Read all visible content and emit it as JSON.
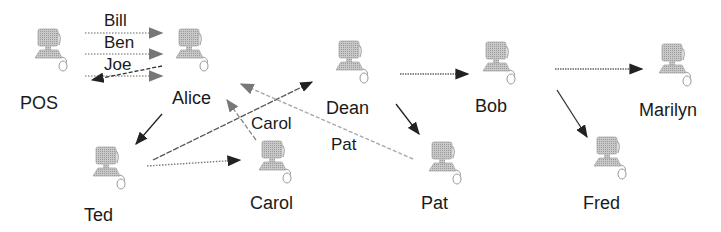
{
  "diagram": {
    "nodes": [
      {
        "id": "pos",
        "label": "POS"
      },
      {
        "id": "alice",
        "label": "Alice"
      },
      {
        "id": "ted",
        "label": "Ted"
      },
      {
        "id": "carol",
        "label": "Carol"
      },
      {
        "id": "dean",
        "label": "Dean"
      },
      {
        "id": "pat",
        "label": "Pat"
      },
      {
        "id": "bob",
        "label": "Bob"
      },
      {
        "id": "fred",
        "label": "Fred"
      },
      {
        "id": "marilyn",
        "label": "Marilyn"
      }
    ],
    "edges": [
      {
        "from": "pos",
        "to": "alice",
        "label": "Bill",
        "style": "dotted"
      },
      {
        "from": "pos",
        "to": "alice",
        "label": "Ben",
        "style": "dotted"
      },
      {
        "from": "pos",
        "to": "alice",
        "label": "Joe",
        "style": "dotted"
      },
      {
        "from": "alice",
        "to": "pos",
        "label": "",
        "style": "dashed"
      },
      {
        "from": "alice",
        "to": "ted",
        "label": "",
        "style": "solid"
      },
      {
        "from": "ted",
        "to": "carol",
        "label": "",
        "style": "dotted"
      },
      {
        "from": "ted",
        "to": "dean",
        "label": "",
        "style": "dashed"
      },
      {
        "from": "carol",
        "to": "alice",
        "label": "Carol",
        "style": "dashed"
      },
      {
        "from": "pat",
        "to": "alice",
        "label": "Pat",
        "style": "dotted"
      },
      {
        "from": "dean",
        "to": "bob",
        "label": "",
        "style": "dotted"
      },
      {
        "from": "dean",
        "to": "pat",
        "label": "",
        "style": "solid"
      },
      {
        "from": "bob",
        "to": "marilyn",
        "label": "",
        "style": "dotted"
      },
      {
        "from": "bob",
        "to": "fred",
        "label": "",
        "style": "solid"
      }
    ],
    "edge_labels": {
      "bill": "Bill",
      "ben": "Ben",
      "joe": "Joe",
      "carol": "Carol",
      "pat": "Pat"
    }
  }
}
